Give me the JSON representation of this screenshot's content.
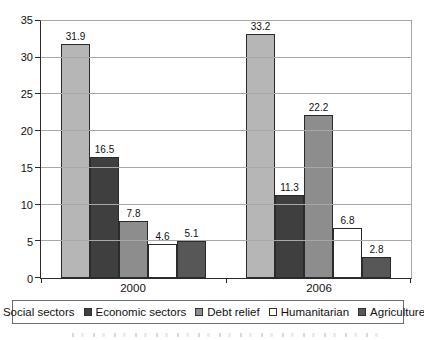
{
  "chart_data": {
    "type": "bar",
    "categories": [
      "2000",
      "2006"
    ],
    "series": [
      {
        "name": "Social sectors",
        "color": "#b6b6b6",
        "values": [
          31.9,
          33.2
        ]
      },
      {
        "name": "Economic sectors",
        "color": "#3f3f3f",
        "values": [
          16.5,
          11.3
        ]
      },
      {
        "name": "Debt relief",
        "color": "#8d8d8d",
        "values": [
          7.8,
          22.2
        ]
      },
      {
        "name": "Humanitarian",
        "color": "#ffffff",
        "values": [
          4.6,
          6.8
        ]
      },
      {
        "name": "Agriculture",
        "color": "#575757",
        "values": [
          5.1,
          2.8
        ]
      }
    ],
    "title": "",
    "xlabel": "",
    "ylabel": "",
    "ylim": [
      0,
      35
    ],
    "ytick_step": 5,
    "grid": true,
    "legend_position": "bottom",
    "colors": {
      "axis": "#2b2b2b",
      "gridline": "#a8a8a8",
      "legend_border": "#6e6e6e",
      "background": "#ffffff"
    }
  }
}
